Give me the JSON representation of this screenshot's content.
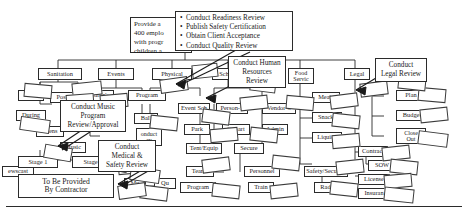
{
  "diagram": {
    "line_color": "#2b2b2b",
    "background": "#ffffff"
  },
  "callouts": [
    {
      "id": "scope-statement",
      "name": "scope-statement-callout",
      "lines": [
        "Provide a",
        "400 emplo",
        "with progr",
        "children a"
      ]
    },
    {
      "id": "readiness-checklist",
      "name": "readiness-checklist-callout",
      "items": [
        "Conduct Readiness Review",
        "Publish Safety Certification",
        "Obtain Client Acceptance",
        "Conduct Quality Review"
      ]
    },
    {
      "id": "hr-review",
      "name": "conduct-human-resources-review-callout",
      "lines": [
        "Conduct Human",
        "Resources",
        "Review"
      ]
    },
    {
      "id": "legal-review",
      "name": "conduct-legal-review-callout",
      "lines": [
        "Conduct",
        "Legal Review"
      ]
    },
    {
      "id": "music-review",
      "name": "conduct-music-program-review-callout",
      "lines": [
        "Conduct Music",
        "Program",
        "Review/Approval"
      ]
    },
    {
      "id": "medical-review",
      "name": "conduct-medical-safety-review-callout",
      "lines": [
        "Conduct",
        "Medical &",
        "Safety Review"
      ]
    }
  ],
  "nodes": {
    "sanitation": "Sanitation",
    "events": "Events",
    "physical": "Physical",
    "schedule": "Schedule",
    "food_services_l1": "Food",
    "food_services_l2": "Servic",
    "legal": "Legal",
    "pre": "Pre-",
    "post": "Post",
    "during": "During",
    "childrens": "Children's",
    "program": "Program",
    "event_sch": "Event Sch",
    "person_s": "Person-S",
    "vendor_s": "Vendor-S",
    "meals": "Meals",
    "plan": "Plan",
    "budget": "Budget",
    "teens": "Teens",
    "k6": "K-6",
    "ball": "Ball",
    "park": "Park",
    "depart": "Depart",
    "admin": "Admin",
    "snacks": "Snacks",
    "close_out_l1": "Close",
    "close_out_l2": "Out",
    "music": "Music",
    "patent": "Patent",
    "conduct_day_l1": "onduct",
    "conduct_day_l2": "ay",
    "barricade": "Barric",
    "tent_equip": "Tent/Equip",
    "secure": "Secure",
    "liquids": "Liquids",
    "contract": "Contract",
    "stage1": "Stage 1",
    "stage2": "Stage 2",
    "newscast": "ewscast",
    "teams": "Teams",
    "personnel": "Personnel",
    "safety_security": "Safety/Security",
    "sow": "SOW",
    "to_be_provided_l1": "To Be Provided",
    "to_be_provided_l2": "By Contractor",
    "music_b": "Mu",
    "qa": "Qu",
    "program_b": "Program",
    "train": "Train",
    "radio": "Radio",
    "license": "License",
    "insurance": "Insuran"
  }
}
